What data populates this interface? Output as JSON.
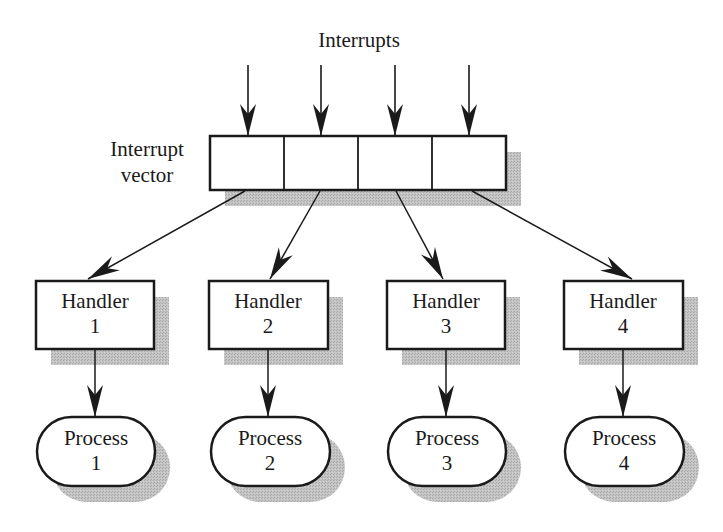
{
  "diagram": {
    "title_label": "Interrupts",
    "vector_label_line1": "Interrupt",
    "vector_label_line2": "vector",
    "colors": {
      "stroke": "#1a1a1a",
      "shadow": "#b9b9b9",
      "fill": "#ffffff"
    },
    "interrupt_vector": {
      "cells": 4
    },
    "handlers": [
      {
        "label": "Handler",
        "number": "1"
      },
      {
        "label": "Handler",
        "number": "2"
      },
      {
        "label": "Handler",
        "number": "3"
      },
      {
        "label": "Handler",
        "number": "4"
      }
    ],
    "processes": [
      {
        "label": "Process",
        "number": "1"
      },
      {
        "label": "Process",
        "number": "2"
      },
      {
        "label": "Process",
        "number": "3"
      },
      {
        "label": "Process",
        "number": "4"
      }
    ]
  }
}
